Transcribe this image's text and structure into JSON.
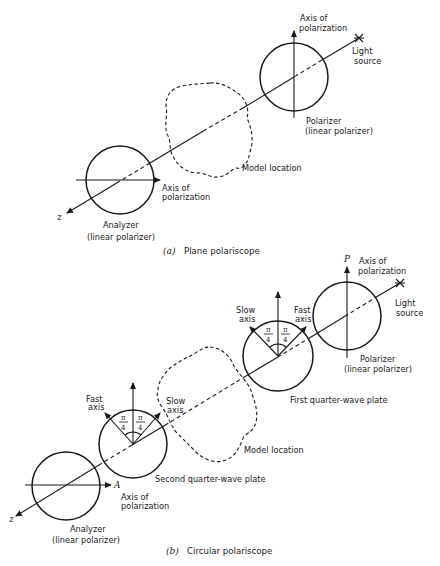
{
  "figure": {
    "part_a": {
      "caption_letter": "(a)",
      "caption": "Plane polariscope",
      "polarizer_axis_label": [
        "Axis of",
        "polarization"
      ],
      "light_source_label": [
        "Light",
        "source"
      ],
      "polarizer_label": [
        "Polarizer",
        "(linear polarizer)"
      ],
      "model_label": "Model location",
      "analyzer_axis_label": [
        "Axis of",
        "polarization"
      ],
      "analyzer_label": [
        "Analyzer",
        "(linear polarizer)"
      ],
      "z_label": "z"
    },
    "part_b": {
      "caption_letter": "(b)",
      "caption": "Circular polariscope",
      "p_label": "P",
      "polarizer_axis_label": [
        "Axis of",
        "polarization"
      ],
      "light_source_label": [
        "Light",
        "source"
      ],
      "polarizer_label": [
        "Polarizer",
        "(linear polarizer)"
      ],
      "first_qwp": {
        "label": "First quarter-wave plate",
        "left_axis": [
          "Slow",
          "axis"
        ],
        "right_axis": [
          "Fast",
          "axis"
        ],
        "angle_left": {
          "num": "π",
          "den": "4"
        },
        "angle_right": {
          "num": "π",
          "den": "4"
        }
      },
      "second_qwp": {
        "label": "Second quarter-wave plate",
        "left_axis": [
          "Fast",
          "axis"
        ],
        "right_axis": [
          "Slow",
          "axis"
        ],
        "angle_left": {
          "num": "π",
          "den": "4"
        },
        "angle_right": {
          "num": "π",
          "den": "4"
        }
      },
      "model_label": "Model location",
      "a_label": "A",
      "analyzer_axis_label": [
        "Axis of",
        "polarization"
      ],
      "analyzer_label": [
        "Analyzer",
        "(linear polarizer)"
      ],
      "z_label": "z"
    }
  }
}
